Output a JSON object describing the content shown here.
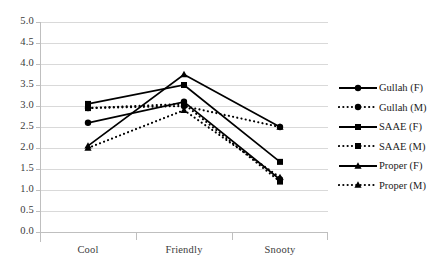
{
  "chart_data": {
    "type": "line",
    "title": "",
    "xlabel": "",
    "ylabel": "",
    "categories": [
      "Cool",
      "Friendly",
      "Snooty"
    ],
    "ylim": [
      0.0,
      5.0
    ],
    "ytick_step": 0.5,
    "yticks": [
      "5.0",
      "4.5",
      "4.0",
      "3.5",
      "3.0",
      "2.5",
      "2.0",
      "1.5",
      "1.0",
      "0.5",
      "0.0"
    ],
    "grid": true,
    "legend_position": "right",
    "series": [
      {
        "name": "Gullah (F)",
        "style": "solid",
        "marker": "circle",
        "values": [
          2.6,
          3.1,
          1.25
        ]
      },
      {
        "name": "Gullah (M)",
        "style": "dotted",
        "marker": "circle",
        "values": [
          2.95,
          3.0,
          2.5
        ]
      },
      {
        "name": "SAAE (F)",
        "style": "solid",
        "marker": "square",
        "values": [
          3.05,
          3.5,
          1.67
        ]
      },
      {
        "name": "SAAE (M)",
        "style": "dotted",
        "marker": "square",
        "values": [
          2.95,
          3.05,
          1.2
        ]
      },
      {
        "name": "Proper (F)",
        "style": "solid",
        "marker": "triangle",
        "values": [
          2.05,
          3.75,
          2.5
        ]
      },
      {
        "name": "Proper (M)",
        "style": "dotted",
        "marker": "triangle",
        "values": [
          2.0,
          2.9,
          1.3
        ]
      }
    ]
  },
  "colors": {
    "line": "#000000",
    "grid": "#d9d9d9",
    "axis": "#bfbfbf",
    "tick_text": "#3b3b3b",
    "legend_text": "#1a1a1a",
    "background": "#ffffff"
  }
}
